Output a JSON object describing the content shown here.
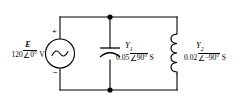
{
  "diagram": {
    "type": "ac-parallel-circuit-schematic",
    "background_color": "#ffffff",
    "line_color": "#000000"
  },
  "source": {
    "name": "voltage-source",
    "symbol": "E",
    "magnitude": "120",
    "angle": "0°",
    "angle_operator": "∠",
    "unit": "V",
    "value_text": "120",
    "plus_label": "+",
    "minus_label": "−",
    "waveform": "sine"
  },
  "capacitor_branch": {
    "name": "admittance-y1",
    "symbol": "Y",
    "subscript": "1",
    "magnitude": "0.05",
    "angle": "90°",
    "angle_operator": "∠",
    "unit": "S",
    "component": "capacitor"
  },
  "inductor_branch": {
    "name": "admittance-y2",
    "symbol": "Y",
    "subscript": "2",
    "magnitude": "0.02",
    "angle": "−90°",
    "angle_operator": "∠",
    "unit": "S",
    "component": "inductor"
  },
  "nodes": {
    "top_node_label": "",
    "bottom_node_label": ""
  }
}
